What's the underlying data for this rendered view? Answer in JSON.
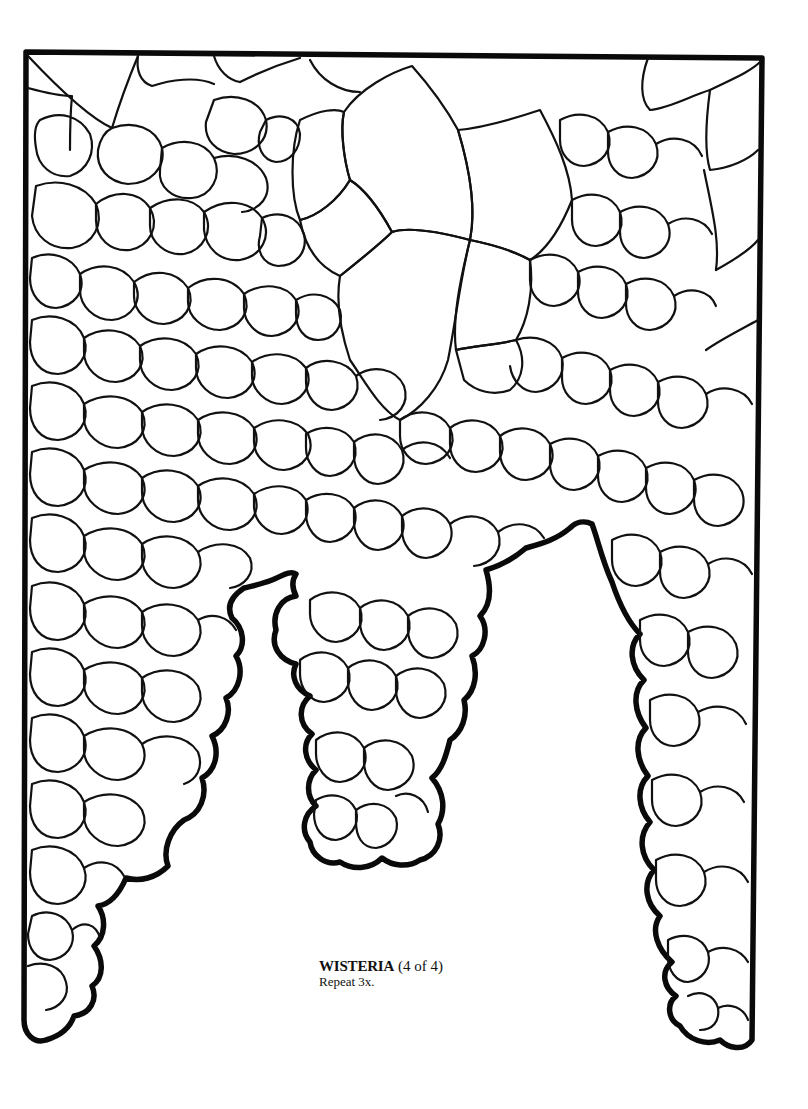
{
  "artwork": {
    "subject": "wisteria stained-glass pattern",
    "style": "black line art on white"
  },
  "caption": {
    "title": "WISTERIA",
    "part": "(4 of 4)",
    "note": "Repeat 3x."
  },
  "colors": {
    "background": "#ffffff",
    "lines": "#111111"
  }
}
